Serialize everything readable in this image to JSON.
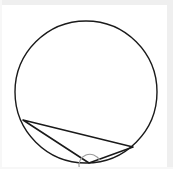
{
  "figure": {
    "title": "Triangle inscribed in a circle with marked angle at lower vertex",
    "background_color": "#ffffff",
    "frame_color": "#efefef",
    "stroke_color": "#1a1a1a",
    "angle_arc_color": "#9a9a9a",
    "canvas": {
      "width": 173,
      "height": 169
    },
    "circle": {
      "label": "circumscribed-circle",
      "center_x": 86,
      "center_y": 92,
      "radius": 71,
      "stroke_color": "#1a1a1a",
      "stroke_width": 1.4,
      "fill": "none"
    },
    "triangle": {
      "label": "inscribed-triangle",
      "stroke_color": "#1a1a1a",
      "stroke_width": 1.6,
      "fill": "none",
      "points": "23,120 89,163 133,147",
      "vertices": [
        {
          "name": "left-vertex",
          "x": 23,
          "y": 120
        },
        {
          "name": "bottom-vertex",
          "x": 89,
          "y": 163
        },
        {
          "name": "right-vertex",
          "x": 133,
          "y": 147
        }
      ]
    },
    "angle_arc": {
      "label": "angle-mark-at-bottom-vertex",
      "at_vertex": "bottom-vertex",
      "center_x": 89,
      "center_y": 163,
      "radius": 11,
      "path": "M 79.2 168.0 A 11 11 0 0 1 99.6 160.2",
      "stroke_color": "#9a9a9a",
      "stroke_width": 1.1,
      "fill": "none"
    }
  }
}
